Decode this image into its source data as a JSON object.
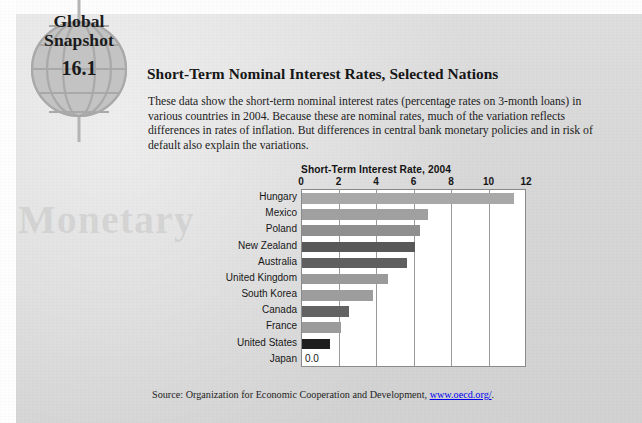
{
  "badge": {
    "line1": "Global",
    "line2": "Snapshot",
    "number": "16.1",
    "icon": "globe-icon"
  },
  "watermark": "Monetary",
  "headline": "Short-Term Nominal Interest Rates, Selected Nations",
  "blurb": "These data show the short-term nominal interest rates (percentage rates on 3-month loans) in various countries in 2004. Because these are nominal rates, much of the variation reflects differences in rates of inflation. But differences in central bank monetary policies and in risk of default also explain the variations.",
  "source": {
    "prefix": "Source: Organization for Economic Cooperation and Development, ",
    "url": "www.oecd.org/",
    "suffix": "."
  },
  "chart_data": {
    "type": "bar",
    "orientation": "horizontal",
    "title": "Short-Term Interest Rate, 2004",
    "xlabel": "",
    "ylabel": "",
    "xlim": [
      0,
      12
    ],
    "ticks": [
      0,
      2,
      4,
      6,
      8,
      10,
      12
    ],
    "tick_labels": [
      "0",
      "2",
      "4",
      "6",
      "8",
      "10",
      "12"
    ],
    "grid": "vertical",
    "legend": "none",
    "categories": [
      "Hungary",
      "Mexico",
      "Poland",
      "New Zealand",
      "Australia",
      "United Kingdom",
      "South Korea",
      "Canada",
      "France",
      "United States",
      "Japan"
    ],
    "values": [
      11.3,
      6.7,
      6.3,
      6.0,
      5.6,
      4.6,
      3.8,
      2.5,
      2.1,
      1.5,
      0.0
    ],
    "bar_colors": [
      "#a8a8a8",
      "#a0a0a0",
      "#8f8f8f",
      "#585858",
      "#5f5f5f",
      "#9a9a9a",
      "#9d9d9d",
      "#636363",
      "#9b9b9b",
      "#1e1e1e",
      "#ffffff"
    ],
    "data_labels": {
      "Japan": "0.0"
    }
  },
  "colors": {
    "page_background": "#d7d7d7",
    "plot_background": "#ffffff",
    "gridline": "#9a9a9a",
    "text": "#171717"
  }
}
